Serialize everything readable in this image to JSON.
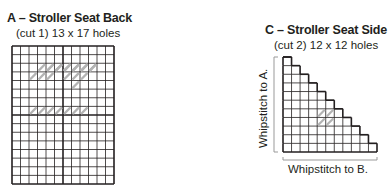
{
  "pieceA": {
    "title": "A – Stroller Seat Back",
    "subtitle": "(cut 1) 13 x 17 holes",
    "holes_wide": 13,
    "holes_high": 17
  },
  "pieceC": {
    "title": "C – Stroller Seat Side",
    "subtitle": "(cut 2) 12 x 12 holes",
    "holes_wide": 12,
    "holes_high": 12,
    "left_label": "Whipstitch to A.",
    "bottom_label": "Whipstitch to B."
  },
  "colors": {
    "grid": "#231f20",
    "stitch": "#b3b3b3"
  }
}
